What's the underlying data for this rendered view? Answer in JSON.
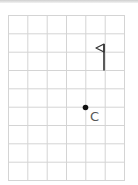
{
  "grid": {
    "columns": 6,
    "rows": 9,
    "line_color": "#d4d4d4"
  },
  "flag": {
    "color": "#333333"
  },
  "point": {
    "label": "C",
    "color": "#111111"
  }
}
